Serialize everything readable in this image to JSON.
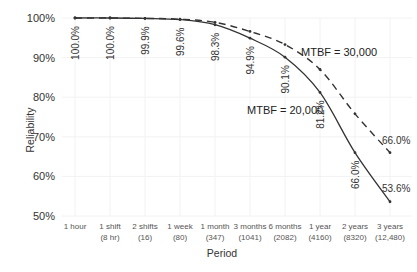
{
  "chart_data": {
    "type": "line",
    "title": "",
    "xlabel": "Period",
    "ylabel": "Reliability",
    "ylim": [
      50,
      100
    ],
    "yticks": [
      "50%",
      "60%",
      "70%",
      "80%",
      "90%",
      "100%"
    ],
    "ytick_values": [
      50,
      60,
      70,
      80,
      90,
      100
    ],
    "grid": true,
    "categories": [
      [
        "1 hour",
        ""
      ],
      [
        "1 shift",
        "(8 hr)"
      ],
      [
        "2 shifts",
        "(16)"
      ],
      [
        "1 week",
        "(80)"
      ],
      [
        "1 month",
        "(347)"
      ],
      [
        "3 months",
        "(1041)"
      ],
      [
        "6 months",
        "(2082)"
      ],
      [
        "1 year",
        "(4160)"
      ],
      [
        "2 years",
        "(8320)"
      ],
      [
        "3 years",
        "(12,480)"
      ]
    ],
    "series": [
      {
        "name": "MTBF = 20,000",
        "style": "solid",
        "values": [
          100.0,
          100.0,
          99.9,
          99.6,
          98.3,
          94.9,
          90.1,
          81.2,
          66.0,
          53.6
        ],
        "labels": [
          "100.0%",
          "100.0%",
          "99.9%",
          "99.6%",
          "98.3%",
          "94.9%",
          "90.1%",
          "81.2%",
          "66.0%",
          "53.6%"
        ]
      },
      {
        "name": "MTBF = 30,000",
        "style": "dashed",
        "values": [
          100.0,
          100.0,
          99.9,
          99.7,
          98.9,
          96.6,
          93.3,
          87.0,
          75.8,
          66.0
        ],
        "labels": [
          "",
          "",
          "",
          "",
          "",
          "",
          "",
          "",
          "",
          "66.0%"
        ]
      }
    ],
    "annotations": [
      {
        "text": "MTBF = 20,000",
        "series": 0
      },
      {
        "text": "MTBF = 30,000",
        "series": 1
      }
    ]
  }
}
